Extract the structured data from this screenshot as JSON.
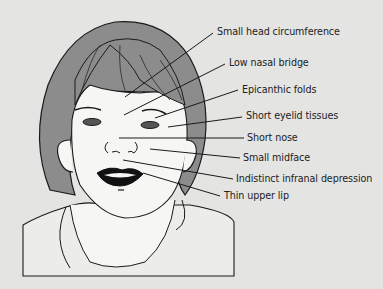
{
  "figure": {
    "background_color": "#e4e4e2",
    "line_color": "#1a1a1a",
    "hair_color": "#8c8c8c",
    "skin_color": "#f6f6f4"
  },
  "labels": [
    {
      "text": "Small head circumference",
      "x": 217,
      "y": 26,
      "line": [
        125,
        97,
        213,
        33
      ]
    },
    {
      "text": "Low nasal bridge",
      "x": 229,
      "y": 57,
      "line": [
        124,
        115,
        225,
        64
      ]
    },
    {
      "text": "Epicanthic folds",
      "x": 242,
      "y": 84,
      "line": [
        155,
        118,
        238,
        90
      ]
    },
    {
      "text": "Short eyelid tissues",
      "x": 246,
      "y": 110,
      "line": [
        168,
        127,
        242,
        117
      ]
    },
    {
      "text": "Short nose",
      "x": 247,
      "y": 132,
      "line": [
        119,
        138,
        244,
        138
      ]
    },
    {
      "text": "Small midface",
      "x": 243,
      "y": 152,
      "line": [
        150,
        149,
        240,
        158
      ]
    },
    {
      "text": "Indistinct infranal depression",
      "x": 236,
      "y": 173,
      "line": [
        123,
        160,
        233,
        179
      ]
    },
    {
      "text": "Thin upper lip",
      "x": 224,
      "y": 190,
      "line": [
        143,
        173,
        220,
        196
      ]
    }
  ]
}
